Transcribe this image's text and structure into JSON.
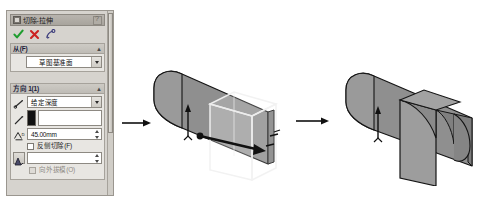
{
  "panel": {
    "title": "切除-拉伸",
    "title_icon": "cut-extrude-icon",
    "help_icon": "help-icon",
    "toolbar": {
      "ok_label": "✔",
      "cancel_label": "✘",
      "help_label": "?",
      "ok_icon": "check-icon",
      "cancel_icon": "x-icon",
      "detail_icon": "help-detail-icon"
    },
    "sections": [
      {
        "id": "from",
        "header": "从(F)",
        "collapse_caret": "▲",
        "icon": "sketch-plane-icon",
        "combo_value": "草图基准面"
      },
      {
        "id": "direction1",
        "header": "方向 1(1)",
        "collapse_caret": "▲",
        "end_condition_icon": "end-condition-icon",
        "end_condition_value": "给定深度",
        "reverse_icon": "reverse-direction-icon",
        "direction_ref_value": "",
        "depth_icon": "depth-icon",
        "depth_value": "45.00mm",
        "flip_side_label": "反侧切除(F)",
        "flip_side_checked": false,
        "draft_icon": "draft-angle-icon",
        "draft_value": "",
        "draft_outward_label": "向外拔模(O)",
        "draft_outward_checked": false,
        "draft_outward_disabled": true
      }
    ],
    "scrollbar": "vertical-scrollbar"
  },
  "graphics": {
    "arrow1": "flow-arrow-right",
    "arrow2": "flow-arrow-right",
    "preview_model": {
      "name": "cylinder-with-cut-preview",
      "direction_arrow": "extrude-direction-arrow",
      "up_arrow": "origin-up-arrow"
    },
    "result_model": {
      "name": "cylinder-with-notch-result",
      "up_arrow": "origin-up-arrow"
    }
  },
  "colors": {
    "panel_bg": "#d6d3ce",
    "section_bg": "#e8e6e2",
    "header_bg": "#cdcac4",
    "field_bg": "#ffffff",
    "border": "#8d8982",
    "model_fill": "#8a8a8a",
    "model_edge": "#1a1a1a",
    "ok_green": "#1f9d2f",
    "cancel_red": "#cc2222"
  }
}
